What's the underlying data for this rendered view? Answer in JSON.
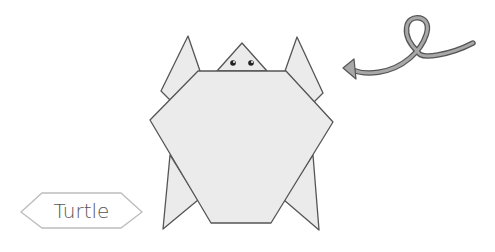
{
  "diagram": {
    "label": "Turtle",
    "colors": {
      "fill": "#ebebeb",
      "stroke": "#555555",
      "arrow_fill": "#a8a8a8",
      "label_border": "#bdbdbd"
    },
    "parts": [
      "head",
      "front-left-flipper",
      "front-right-flipper",
      "shell-body",
      "back-left-flipper",
      "back-right-flipper",
      "eyes"
    ],
    "arrow": {
      "direction": "left",
      "style": "curved-loop"
    }
  }
}
